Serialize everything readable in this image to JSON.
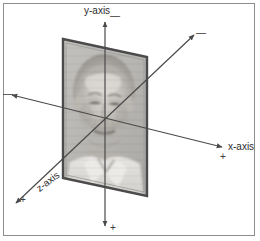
{
  "figure": {
    "title": "",
    "background_color": "#ffffff",
    "frame_color": "#8d8d8d",
    "axis_color": "#4a4a4a",
    "photo_border_color": "#4b4b4b",
    "photo_fill_color": "#b9b9b9"
  },
  "axes": {
    "x": {
      "label": "x-axis",
      "positive_sign": "+",
      "negative_sign": "—",
      "positive_direction": "right",
      "negative_direction": "left"
    },
    "y": {
      "label": "y-axis",
      "positive_sign": "+",
      "negative_sign": "—",
      "positive_direction": "down",
      "negative_direction": "up"
    },
    "z": {
      "label": "z-axis",
      "positive_sign": "+",
      "negative_sign": "—",
      "positive_direction": "lower-left",
      "negative_direction": "upper-right"
    }
  },
  "photo": {
    "alt": "portrait of an elderly man",
    "shape": "parallelogram"
  }
}
